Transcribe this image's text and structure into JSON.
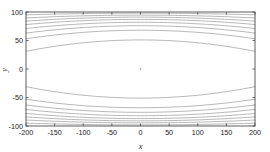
{
  "figure": {
    "background_color": "#ffffff",
    "plot_background_color": "#ffffff",
    "axis_color": "#4d4d4d",
    "contour_color": "#8c8c8c"
  },
  "chart_data": {
    "type": "line",
    "plot_style": "contour",
    "title": "",
    "subtitle": "",
    "xlabel": "x",
    "ylabel": "y",
    "xlim": [
      -200,
      200
    ],
    "ylim": [
      -100,
      100
    ],
    "xticks": [
      -200,
      -150,
      -100,
      -50,
      0,
      50,
      100,
      150,
      200
    ],
    "xticklabels": [
      "-200",
      "-150",
      "-100",
      "-50",
      "0",
      "50",
      "100",
      "150",
      "200"
    ],
    "yticks": [
      -100,
      -50,
      0,
      50,
      100
    ],
    "yticklabels": [
      "-100",
      "-50",
      "0",
      "50",
      "100"
    ],
    "grid": false,
    "legend": null,
    "legend_position": "none",
    "annotations": [
      {
        "label": "center-point-contour",
        "x": 0,
        "y": 0,
        "description": "tiny closed contour at origin"
      }
    ],
    "series": [
      {
        "name": "contour-upper-1",
        "level": 1,
        "y_edge": 95.0,
        "y_center": 98.0
      },
      {
        "name": "contour-upper-2",
        "level": 2,
        "y_edge": 89.5,
        "y_center": 94.5
      },
      {
        "name": "contour-upper-3",
        "level": 3,
        "y_edge": 84.0,
        "y_center": 91.0
      },
      {
        "name": "contour-upper-4",
        "level": 4,
        "y_edge": 78.0,
        "y_center": 87.0
      },
      {
        "name": "contour-upper-5",
        "level": 5,
        "y_edge": 71.0,
        "y_center": 82.0
      },
      {
        "name": "contour-upper-6",
        "level": 6,
        "y_edge": 63.0,
        "y_center": 76.0
      },
      {
        "name": "contour-upper-7",
        "level": 7,
        "y_edge": 53.0,
        "y_center": 68.0
      },
      {
        "name": "contour-upper-8",
        "level": 8,
        "y_edge": 31.0,
        "y_center": 51.0
      },
      {
        "name": "contour-lower-8",
        "level": -8,
        "y_edge": -31.0,
        "y_center": -51.0
      },
      {
        "name": "contour-lower-7",
        "level": -7,
        "y_edge": -53.0,
        "y_center": -68.0
      },
      {
        "name": "contour-lower-6",
        "level": -6,
        "y_edge": -63.0,
        "y_center": -76.0
      },
      {
        "name": "contour-lower-5",
        "level": -5,
        "y_edge": -71.0,
        "y_center": -82.0
      },
      {
        "name": "contour-lower-4",
        "level": -4,
        "y_edge": -78.0,
        "y_center": -87.0
      },
      {
        "name": "contour-lower-3",
        "level": -3,
        "y_edge": -84.0,
        "y_center": -91.0
      },
      {
        "name": "contour-lower-2",
        "level": -2,
        "y_edge": -89.5,
        "y_center": -94.5
      },
      {
        "name": "contour-lower-1",
        "level": -1,
        "y_edge": -95.0,
        "y_center": -98.0
      }
    ]
  }
}
